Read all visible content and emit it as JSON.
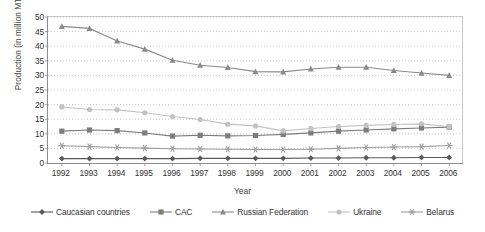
{
  "chart_data": {
    "type": "line",
    "title": "",
    "xlabel": "Year",
    "ylabel": "Production (in million MT)",
    "categories": [
      "1992",
      "1993",
      "1994",
      "1995",
      "1996",
      "1997",
      "1998",
      "1999",
      "2000",
      "2001",
      "2002",
      "2003",
      "2004",
      "2005",
      "2006"
    ],
    "ylim": [
      0,
      50
    ],
    "ytick_step": 5,
    "yticks": [
      0,
      5,
      10,
      15,
      20,
      25,
      30,
      35,
      40,
      45,
      50
    ],
    "grid": "horizontal-dotted",
    "legend_position": "bottom",
    "series": [
      {
        "name": "Caucasian countries",
        "marker": "diamond",
        "color": "#595959",
        "values": [
          1.5,
          1.5,
          1.5,
          1.5,
          1.5,
          1.6,
          1.6,
          1.6,
          1.6,
          1.7,
          1.7,
          1.8,
          1.8,
          1.9,
          1.9
        ]
      },
      {
        "name": "CAC",
        "marker": "square",
        "color": "#7d7d7d",
        "values": [
          10.9,
          11.3,
          11.1,
          10.3,
          9.2,
          9.5,
          9.3,
          9.4,
          9.8,
          10.3,
          10.9,
          11.3,
          11.7,
          12.0,
          12.3
        ]
      },
      {
        "name": "Russian Federation",
        "marker": "triangle",
        "color": "#8a8a8a",
        "values": [
          46.8,
          46.1,
          41.8,
          39.0,
          35.2,
          33.5,
          32.7,
          31.3,
          31.2,
          32.2,
          32.8,
          32.8,
          31.7,
          30.8,
          30.0
        ]
      },
      {
        "name": "Ukraine",
        "marker": "circle",
        "color": "#c2c2c2",
        "values": [
          19.2,
          18.3,
          18.2,
          17.2,
          15.9,
          14.9,
          13.3,
          12.7,
          11.0,
          11.8,
          12.5,
          12.9,
          13.2,
          13.4,
          12.4
        ]
      },
      {
        "name": "Belarus",
        "marker": "asterisk",
        "color": "#9e9e9e",
        "values": [
          5.9,
          5.6,
          5.3,
          5.1,
          4.9,
          4.8,
          4.7,
          4.6,
          4.6,
          4.7,
          5.0,
          5.3,
          5.5,
          5.6,
          6.0
        ]
      }
    ],
    "colors": {
      "axis": "#8d8d8d",
      "grid": "#bfbfbf",
      "frame": "#c9c9c9",
      "text": "#333333"
    }
  }
}
